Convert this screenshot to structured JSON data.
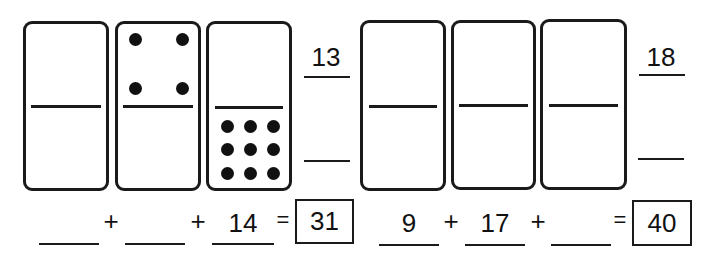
{
  "puzzle_left": {
    "dominoes": [
      {
        "top_pips": 0,
        "bottom_pips": 0
      },
      {
        "top_pips": 4,
        "bottom_pips": 0
      },
      {
        "top_pips": 0,
        "bottom_pips": 9
      }
    ],
    "side_top_value": "13",
    "side_bottom_value": "",
    "equation": {
      "term1": "",
      "op1": "+",
      "term2": "",
      "op2": "+",
      "term3": "14",
      "equals": "=",
      "total": "31"
    }
  },
  "puzzle_right": {
    "dominoes": [
      {
        "top_pips": 0,
        "bottom_pips": 0
      },
      {
        "top_pips": 0,
        "bottom_pips": 0
      },
      {
        "top_pips": 0,
        "bottom_pips": 0
      }
    ],
    "side_top_value": "18",
    "side_bottom_value": "",
    "equation": {
      "term1": "9",
      "op1": "+",
      "term2": "17",
      "op2": "+",
      "term3": "",
      "equals": "=",
      "total": "40"
    }
  }
}
